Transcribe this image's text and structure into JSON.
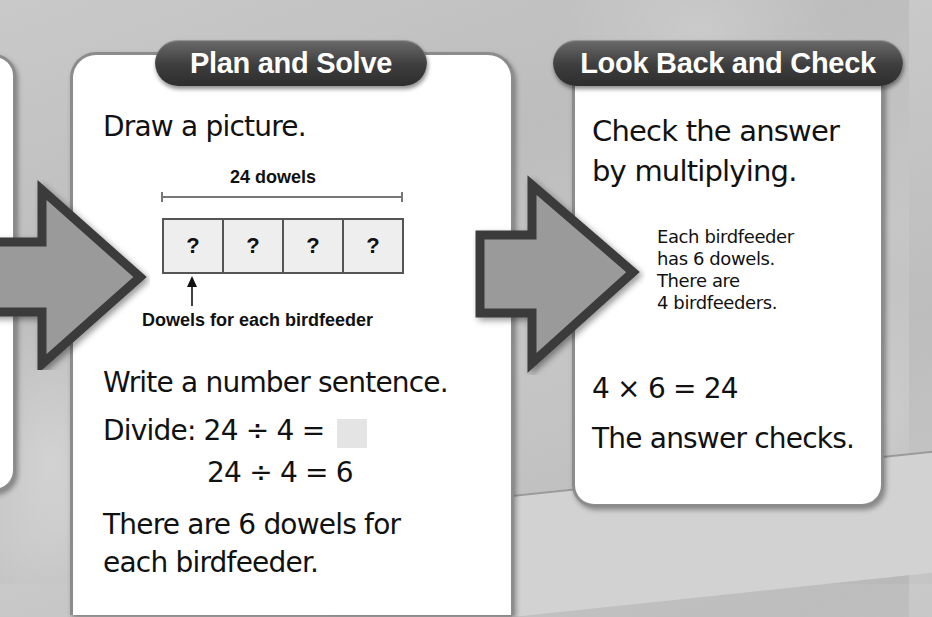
{
  "steps": [
    {
      "id": "plan-and-solve",
      "title": "Plan and Solve",
      "instruction_1": "Draw a picture.",
      "diagram": {
        "total_label": "24 dowels",
        "boxes": [
          "?",
          "?",
          "?",
          "?"
        ],
        "pointer_label": "Dowels for each birdfeeder"
      },
      "instruction_2": "Write a number sentence.",
      "equation_1": "Divide: 24 ÷ 4 =",
      "equation_2": "24 ÷ 4 =  6",
      "conclusion_line_1": "There are 6 dowels for",
      "conclusion_line_2": "each birdfeeder."
    },
    {
      "id": "look-back-and-check",
      "title": "Look Back and Check",
      "instruction_line_1": "Check the answer",
      "instruction_line_2": "by multiplying.",
      "note_lines": [
        "Each birdfeeder",
        "has 6 dowels.",
        "There are",
        "4 birdfeeders."
      ],
      "equation": "4 × 6 = 24",
      "conclusion": "The answer checks."
    }
  ],
  "icons": {
    "flow_arrow": "right-block-arrow",
    "pointer_arrow": "up-arrow"
  },
  "colors": {
    "pill_bg": "#3d3d3d",
    "arrow_fill": "#9a9a9a",
    "arrow_stroke": "#3a3a3a",
    "card_border": "#8c8c8c",
    "background": "#c4c4c4",
    "answer_blank": "#e4e4e4"
  }
}
